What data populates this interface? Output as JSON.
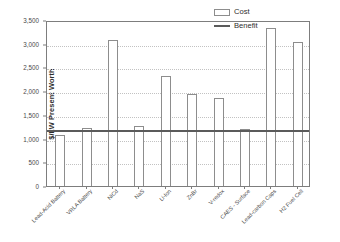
{
  "chart_data": {
    "type": "bar",
    "title": "",
    "subtitle": "",
    "xlabel": "",
    "ylabel": "$/kW Present Worth",
    "ylim": [
      0,
      3500
    ],
    "ytick_step": 500,
    "yticks": [
      "0",
      "500",
      "1,000",
      "1,500",
      "2,000",
      "2,500",
      "3,000",
      "3,500"
    ],
    "ytick_values": [
      0,
      500,
      1000,
      1500,
      2000,
      2500,
      3000,
      3500
    ],
    "grid": true,
    "legend_position": "top-right",
    "categories": [
      "Lead-Acid Battery",
      "VRLA Battery",
      "NiCd",
      "NaS",
      "Li-Ion",
      "ZnBr",
      "V-redox",
      "CAES - Surface",
      "Lead-carbon Caps",
      "H2 Fuel Cell"
    ],
    "series": [
      {
        "name": "Cost",
        "type": "bar",
        "values": [
          1085,
          1230,
          3070,
          1265,
          2330,
          1950,
          1860,
          1210,
          3330,
          3030
        ]
      },
      {
        "name": "Benefit",
        "type": "line",
        "constant_value": 1155,
        "values": [
          1155,
          1155,
          1155,
          1155,
          1155,
          1155,
          1155,
          1155,
          1155,
          1155
        ]
      }
    ],
    "legend": [
      "Cost",
      "Benefit"
    ],
    "colors": {
      "bar_fill": "#ffffff",
      "bar_stroke": "#8d8d8d",
      "benefit_line": "#5b5b5b",
      "grid": "#c2c2c2",
      "axis": "#7d7d7d",
      "text": "#4a4a4a"
    }
  },
  "legend": {
    "cost_label": "Cost",
    "benefit_label": "Benefit"
  },
  "axis": {
    "y_title": "$/kW Present Worth"
  }
}
